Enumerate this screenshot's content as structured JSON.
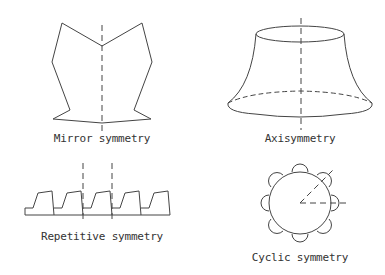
{
  "diagram": {
    "panels": [
      {
        "id": "mirror",
        "label": "Mirror symmetry"
      },
      {
        "id": "axisymmetry",
        "label": "Axisymmetry"
      },
      {
        "id": "repetitive",
        "label": "Repetitive symmetry"
      },
      {
        "id": "cyclic",
        "label": "Cyclic symmetry"
      }
    ],
    "colors": {
      "stroke": "#444444",
      "text": "#333333",
      "background": "#ffffff"
    }
  }
}
